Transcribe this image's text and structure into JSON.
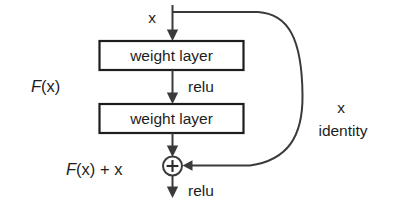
{
  "diagram": {
    "type": "flow-diagram",
    "background_color": "#ffffff",
    "line_color": "#3a3a3a",
    "text_color": "#1d1d1d",
    "nodes": {
      "input_label": "x",
      "weight_layer_1": "weight layer",
      "weight_layer_2": "weight layer",
      "relu_middle": "relu",
      "relu_output": "relu",
      "sum_symbol": "+",
      "function_label": "F(x)",
      "output_label_italic": "F",
      "output_label_rest": "(x) + x",
      "function_label_italic": "F",
      "function_label_rest": "(x)",
      "skip_label_top": "x",
      "skip_label_bottom": "identity"
    },
    "edges": [
      {
        "name": "input-to-layer1",
        "from": "x",
        "to": "weight layer",
        "style": "arrow-down"
      },
      {
        "name": "layer1-to-layer2",
        "from": "weight layer",
        "to": "weight layer",
        "style": "arrow-down",
        "label": "relu"
      },
      {
        "name": "layer2-to-sum",
        "from": "weight layer",
        "to": "+",
        "style": "arrow-down"
      },
      {
        "name": "identity-skip",
        "from": "x",
        "to": "+",
        "style": "curved-arrow",
        "label": "x identity"
      },
      {
        "name": "sum-to-output",
        "from": "+",
        "to": "output",
        "style": "arrow-down",
        "label": "relu"
      }
    ]
  }
}
